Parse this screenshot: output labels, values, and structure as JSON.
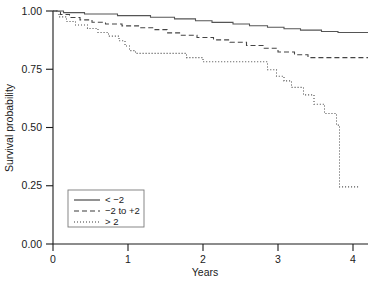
{
  "chart_data": {
    "type": "line",
    "subtype": "kaplan-meier-step",
    "title": "",
    "xlabel": "Years",
    "ylabel": "Survival probability",
    "xlim": [
      0,
      4.2
    ],
    "ylim": [
      0,
      1.0
    ],
    "xticks": [
      0,
      1,
      2,
      3,
      4
    ],
    "xtick_labels": [
      "0",
      "1",
      "2",
      "3",
      "4"
    ],
    "yticks": [
      0.0,
      0.25,
      0.5,
      0.75,
      1.0
    ],
    "ytick_labels": [
      "0.00",
      "0.25",
      "0.50",
      "0.75",
      "1.00"
    ],
    "grid": false,
    "legend_position": "bottom-left",
    "series": [
      {
        "name": "< −2",
        "linestyle": "solid",
        "color": "#555555",
        "points": [
          [
            0.0,
            1.0
          ],
          [
            0.14,
            0.993
          ],
          [
            0.42,
            0.987
          ],
          [
            0.86,
            0.98
          ],
          [
            1.3,
            0.973
          ],
          [
            1.62,
            0.966
          ],
          [
            1.9,
            0.958
          ],
          [
            2.12,
            0.951
          ],
          [
            2.4,
            0.944
          ],
          [
            2.62,
            0.937
          ],
          [
            2.86,
            0.93
          ],
          [
            3.08,
            0.924
          ],
          [
            3.3,
            0.918
          ],
          [
            3.58,
            0.912
          ],
          [
            3.8,
            0.908
          ],
          [
            4.2,
            0.908
          ]
        ]
      },
      {
        "name": "−2 to +2",
        "linestyle": "dashed",
        "color": "#444444",
        "points": [
          [
            0.0,
            1.0
          ],
          [
            0.1,
            0.985
          ],
          [
            0.22,
            0.972
          ],
          [
            0.36,
            0.962
          ],
          [
            0.52,
            0.952
          ],
          [
            0.7,
            0.944
          ],
          [
            0.92,
            0.936
          ],
          [
            1.14,
            0.928
          ],
          [
            1.36,
            0.92
          ],
          [
            1.52,
            0.906
          ],
          [
            1.7,
            0.896
          ],
          [
            1.92,
            0.886
          ],
          [
            2.14,
            0.876
          ],
          [
            2.36,
            0.866
          ],
          [
            2.58,
            0.852
          ],
          [
            2.8,
            0.84
          ],
          [
            3.0,
            0.824
          ],
          [
            3.22,
            0.812
          ],
          [
            3.4,
            0.8
          ],
          [
            4.2,
            0.8
          ]
        ]
      },
      {
        "name": "> 2",
        "linestyle": "dotted",
        "color": "#4a4a4a",
        "points": [
          [
            0.0,
            1.0
          ],
          [
            0.08,
            0.975
          ],
          [
            0.18,
            0.955
          ],
          [
            0.3,
            0.94
          ],
          [
            0.46,
            0.925
          ],
          [
            0.6,
            0.908
          ],
          [
            0.74,
            0.892
          ],
          [
            0.88,
            0.872
          ],
          [
            0.96,
            0.85
          ],
          [
            1.02,
            0.83
          ],
          [
            1.1,
            0.818
          ],
          [
            1.7,
            0.818
          ],
          [
            1.78,
            0.8
          ],
          [
            2.0,
            0.782
          ],
          [
            2.78,
            0.782
          ],
          [
            2.86,
            0.748
          ],
          [
            2.98,
            0.72
          ],
          [
            3.08,
            0.7
          ],
          [
            3.18,
            0.672
          ],
          [
            3.34,
            0.64
          ],
          [
            3.48,
            0.6
          ],
          [
            3.62,
            0.56
          ],
          [
            3.78,
            0.51
          ],
          [
            3.82,
            0.5
          ],
          [
            3.82,
            0.245
          ],
          [
            4.08,
            0.245
          ]
        ]
      }
    ],
    "legend_entries": [
      {
        "label": "< −2",
        "linestyle": "solid"
      },
      {
        "label": "−2 to +2",
        "linestyle": "dashed"
      },
      {
        "label": "> 2",
        "linestyle": "dotted"
      }
    ]
  }
}
